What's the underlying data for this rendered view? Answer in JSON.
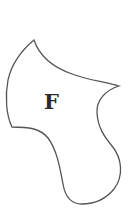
{
  "diagram": {
    "type": "region-shape",
    "shape": {
      "label": "F",
      "stroke_color": "#555555",
      "fill_color": "#ffffff"
    }
  }
}
